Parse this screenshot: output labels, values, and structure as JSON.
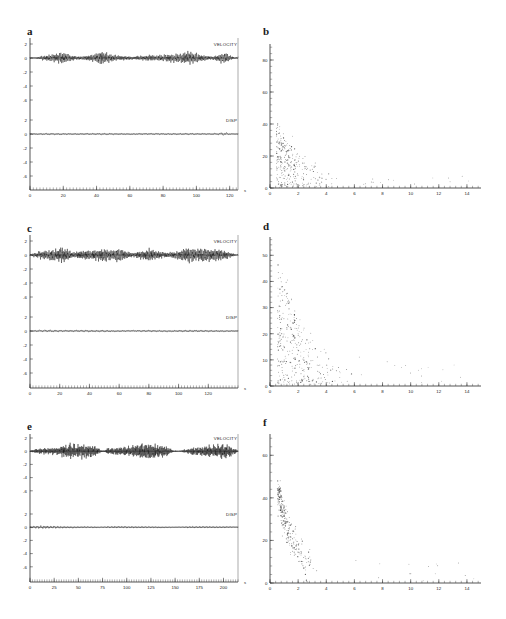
{
  "figure": {
    "background_color": "#ffffff",
    "trace_color": "#111111",
    "dot_color": "#3a3a3a",
    "axis_color": "#2a2a2a",
    "panel_letters": [
      "a",
      "b",
      "c",
      "d",
      "e",
      "f"
    ]
  },
  "panels": {
    "a": {
      "letter": "a",
      "type": "waveform"
    },
    "b": {
      "letter": "b",
      "type": "scatter"
    },
    "c": {
      "letter": "c",
      "type": "waveform"
    },
    "d": {
      "letter": "d",
      "type": "scatter"
    },
    "e": {
      "letter": "e",
      "type": "waveform"
    },
    "f": {
      "letter": "f",
      "type": "scatter"
    }
  },
  "chart_data": [
    {
      "panel": "a",
      "type": "line",
      "title": "",
      "xlabel": "s",
      "ylabel": "",
      "xlim": [
        0,
        125
      ],
      "ylim": [
        -7,
        3
      ],
      "grid": false,
      "legend_position": "right-inline",
      "xticks": [
        0,
        20,
        40,
        60,
        80,
        100,
        120
      ],
      "xtick_labels": [
        "0",
        "20",
        "40",
        "60",
        "80",
        "100",
        "120"
      ],
      "minor_tick_interval": 2,
      "x_unit": "s",
      "subplots": [
        {
          "name": "VELOCITY",
          "label": "VELOCITY",
          "yticks": [
            2,
            0,
            -2,
            -4,
            -6
          ],
          "ytick_labels": [
            "2",
            "0",
            "-2",
            "-4",
            "-6"
          ],
          "amplitude_envelope": [
            {
              "t": 0,
              "a": 0.05
            },
            {
              "t": 4,
              "a": 0.12
            },
            {
              "t": 8,
              "a": 0.3
            },
            {
              "t": 12,
              "a": 0.45
            },
            {
              "t": 16,
              "a": 0.62
            },
            {
              "t": 19,
              "a": 0.85
            },
            {
              "t": 22,
              "a": 0.55
            },
            {
              "t": 27,
              "a": 0.28
            },
            {
              "t": 32,
              "a": 0.22
            },
            {
              "t": 36,
              "a": 0.4
            },
            {
              "t": 40,
              "a": 0.72
            },
            {
              "t": 43,
              "a": 0.88
            },
            {
              "t": 47,
              "a": 0.6
            },
            {
              "t": 52,
              "a": 0.35
            },
            {
              "t": 57,
              "a": 0.26
            },
            {
              "t": 62,
              "a": 0.2
            },
            {
              "t": 67,
              "a": 0.3
            },
            {
              "t": 72,
              "a": 0.42
            },
            {
              "t": 77,
              "a": 0.36
            },
            {
              "t": 82,
              "a": 0.48
            },
            {
              "t": 87,
              "a": 0.58
            },
            {
              "t": 92,
              "a": 0.66
            },
            {
              "t": 96,
              "a": 0.8
            },
            {
              "t": 100,
              "a": 0.62
            },
            {
              "t": 105,
              "a": 0.3
            },
            {
              "t": 110,
              "a": 0.22
            },
            {
              "t": 114,
              "a": 0.55
            },
            {
              "t": 117,
              "a": 0.78
            },
            {
              "t": 120,
              "a": 0.35
            },
            {
              "t": 123,
              "a": 0.1
            }
          ]
        },
        {
          "name": "DISP",
          "label": "DISP",
          "yticks": [
            2,
            0,
            -2,
            -4,
            -6
          ],
          "ytick_labels": [
            "2",
            "0",
            "-2",
            "-4",
            "-6"
          ],
          "amplitude_envelope": [
            {
              "t": 0,
              "a": 0.04
            },
            {
              "t": 6,
              "a": 0.18
            },
            {
              "t": 12,
              "a": 0.24
            },
            {
              "t": 18,
              "a": 0.2
            },
            {
              "t": 24,
              "a": 0.15
            },
            {
              "t": 30,
              "a": 0.12
            },
            {
              "t": 38,
              "a": 0.18
            },
            {
              "t": 45,
              "a": 0.22
            },
            {
              "t": 52,
              "a": 0.14
            },
            {
              "t": 60,
              "a": 0.11
            },
            {
              "t": 68,
              "a": 0.16
            },
            {
              "t": 76,
              "a": 0.2
            },
            {
              "t": 84,
              "a": 0.17
            },
            {
              "t": 92,
              "a": 0.21
            },
            {
              "t": 100,
              "a": 0.18
            },
            {
              "t": 108,
              "a": 0.13
            },
            {
              "t": 114,
              "a": 0.3
            },
            {
              "t": 117,
              "a": 0.55
            },
            {
              "t": 120,
              "a": 0.2
            },
            {
              "t": 123,
              "a": 0.06
            }
          ]
        }
      ]
    },
    {
      "panel": "b",
      "type": "scatter",
      "title": "",
      "xlabel": "",
      "ylabel": "",
      "xlim": [
        0,
        15
      ],
      "ylim": [
        0,
        90
      ],
      "grid": false,
      "xticks": [
        0,
        2,
        4,
        6,
        8,
        10,
        12,
        14
      ],
      "xtick_labels": [
        "0",
        "2",
        "4",
        "6",
        "8",
        "10",
        "12",
        "14"
      ],
      "yticks": [
        0,
        20,
        40,
        60,
        80
      ],
      "ytick_labels": [
        "0",
        "20",
        "40",
        "60",
        "80"
      ],
      "n_points": 300,
      "cluster": {
        "shape": "decaying-L",
        "x_mode": 1.3,
        "x_decay": 1.9,
        "y_max_at_origin": 46,
        "y_spread": 13,
        "tail_x_max": 14.2
      }
    },
    {
      "panel": "c",
      "type": "line",
      "title": "",
      "xlabel": "s",
      "ylabel": "",
      "xlim": [
        0,
        140
      ],
      "ylim": [
        -7,
        3
      ],
      "grid": false,
      "legend_position": "right-inline",
      "xticks": [
        0,
        20,
        40,
        60,
        80,
        100,
        120
      ],
      "xtick_labels": [
        "0",
        "20",
        "40",
        "60",
        "80",
        "100",
        "120"
      ],
      "minor_tick_interval": 2,
      "x_unit": "s",
      "subplots": [
        {
          "name": "VELOCITY",
          "label": "VELOCITY",
          "yticks": [
            2,
            0,
            -2,
            -4,
            -6
          ],
          "ytick_labels": [
            "2",
            "0",
            "-2",
            "-4",
            "-6"
          ],
          "amplitude_envelope": [
            {
              "t": 0,
              "a": 0.06
            },
            {
              "t": 5,
              "a": 0.45
            },
            {
              "t": 10,
              "a": 0.62
            },
            {
              "t": 14,
              "a": 0.7
            },
            {
              "t": 18,
              "a": 0.85
            },
            {
              "t": 21,
              "a": 1.0
            },
            {
              "t": 25,
              "a": 0.7
            },
            {
              "t": 30,
              "a": 0.35
            },
            {
              "t": 34,
              "a": 0.5
            },
            {
              "t": 38,
              "a": 0.72
            },
            {
              "t": 42,
              "a": 0.55
            },
            {
              "t": 46,
              "a": 0.8
            },
            {
              "t": 50,
              "a": 0.95
            },
            {
              "t": 54,
              "a": 0.66
            },
            {
              "t": 58,
              "a": 0.88
            },
            {
              "t": 62,
              "a": 0.72
            },
            {
              "t": 66,
              "a": 0.42
            },
            {
              "t": 70,
              "a": 0.3
            },
            {
              "t": 75,
              "a": 0.55
            },
            {
              "t": 80,
              "a": 0.78
            },
            {
              "t": 84,
              "a": 0.62
            },
            {
              "t": 88,
              "a": 0.4
            },
            {
              "t": 93,
              "a": 0.3
            },
            {
              "t": 98,
              "a": 0.45
            },
            {
              "t": 103,
              "a": 0.8
            },
            {
              "t": 107,
              "a": 0.96
            },
            {
              "t": 111,
              "a": 0.75
            },
            {
              "t": 115,
              "a": 0.9
            },
            {
              "t": 119,
              "a": 1.0
            },
            {
              "t": 123,
              "a": 0.72
            },
            {
              "t": 127,
              "a": 0.85
            },
            {
              "t": 131,
              "a": 0.6
            },
            {
              "t": 135,
              "a": 0.3
            },
            {
              "t": 139,
              "a": 0.08
            }
          ]
        },
        {
          "name": "DISP",
          "label": "DISP",
          "yticks": [
            2,
            0,
            -2,
            -4,
            -6
          ],
          "ytick_labels": [
            "2",
            "0",
            "-2",
            "-4",
            "-6"
          ],
          "amplitude_envelope": [
            {
              "t": 0,
              "a": 0.05
            },
            {
              "t": 6,
              "a": 0.26
            },
            {
              "t": 12,
              "a": 0.32
            },
            {
              "t": 18,
              "a": 0.28
            },
            {
              "t": 24,
              "a": 0.2
            },
            {
              "t": 30,
              "a": 0.24
            },
            {
              "t": 38,
              "a": 0.3
            },
            {
              "t": 44,
              "a": 0.22
            },
            {
              "t": 50,
              "a": 0.26
            },
            {
              "t": 58,
              "a": 0.18
            },
            {
              "t": 66,
              "a": 0.14
            },
            {
              "t": 74,
              "a": 0.2
            },
            {
              "t": 82,
              "a": 0.24
            },
            {
              "t": 90,
              "a": 0.18
            },
            {
              "t": 98,
              "a": 0.22
            },
            {
              "t": 106,
              "a": 0.28
            },
            {
              "t": 114,
              "a": 0.24
            },
            {
              "t": 122,
              "a": 0.2
            },
            {
              "t": 130,
              "a": 0.16
            },
            {
              "t": 136,
              "a": 0.1
            },
            {
              "t": 139,
              "a": 0.05
            }
          ]
        }
      ]
    },
    {
      "panel": "d",
      "type": "scatter",
      "title": "",
      "xlabel": "",
      "ylabel": "",
      "xlim": [
        0,
        15
      ],
      "ylim": [
        0,
        57
      ],
      "grid": false,
      "xticks": [
        0,
        2,
        4,
        6,
        8,
        10,
        12,
        14
      ],
      "xtick_labels": [
        "0",
        "2",
        "4",
        "6",
        "8",
        "10",
        "12",
        "14"
      ],
      "yticks": [
        0,
        10,
        20,
        30,
        40,
        50
      ],
      "ytick_labels": [
        "0",
        "10",
        "20",
        "30",
        "40",
        "50"
      ],
      "n_points": 330,
      "cluster": {
        "shape": "decaying-L",
        "x_mode": 1.5,
        "x_decay": 2.3,
        "y_max_at_origin": 55,
        "y_spread": 14,
        "tail_x_max": 13.6
      }
    },
    {
      "panel": "e",
      "type": "line",
      "title": "",
      "xlabel": "s",
      "ylabel": "",
      "xlim": [
        0,
        215
      ],
      "ylim": [
        -7,
        3
      ],
      "grid": false,
      "legend_position": "right-inline",
      "xticks": [
        0,
        25,
        50,
        75,
        100,
        125,
        150,
        175,
        200
      ],
      "xtick_labels": [
        "0",
        "25",
        "50",
        "75",
        "100",
        "125",
        "150",
        "175",
        "200"
      ],
      "minor_tick_interval": 2.5,
      "x_unit": "s",
      "subplots": [
        {
          "name": "VELOCITY",
          "label": "VELOCITY",
          "yticks": [
            2,
            0,
            -2,
            -4,
            -6
          ],
          "ytick_labels": [
            "2",
            "0",
            "-2",
            "-4",
            "-6"
          ],
          "amplitude_envelope": [
            {
              "t": 0,
              "a": 0.05
            },
            {
              "t": 5,
              "a": 0.3
            },
            {
              "t": 12,
              "a": 0.38
            },
            {
              "t": 20,
              "a": 0.42
            },
            {
              "t": 28,
              "a": 0.55
            },
            {
              "t": 34,
              "a": 0.85
            },
            {
              "t": 40,
              "a": 1.0
            },
            {
              "t": 48,
              "a": 1.0
            },
            {
              "t": 55,
              "a": 0.95
            },
            {
              "t": 62,
              "a": 0.9
            },
            {
              "t": 68,
              "a": 0.7
            },
            {
              "t": 73,
              "a": 0.2
            },
            {
              "t": 76,
              "a": 0.08
            },
            {
              "t": 80,
              "a": 0.42
            },
            {
              "t": 88,
              "a": 0.52
            },
            {
              "t": 96,
              "a": 0.6
            },
            {
              "t": 104,
              "a": 0.75
            },
            {
              "t": 112,
              "a": 0.92
            },
            {
              "t": 120,
              "a": 1.0
            },
            {
              "t": 128,
              "a": 0.98
            },
            {
              "t": 136,
              "a": 0.85
            },
            {
              "t": 143,
              "a": 0.55
            },
            {
              "t": 148,
              "a": 0.12
            },
            {
              "t": 155,
              "a": 0.06
            },
            {
              "t": 163,
              "a": 0.35
            },
            {
              "t": 170,
              "a": 0.58
            },
            {
              "t": 178,
              "a": 0.66
            },
            {
              "t": 186,
              "a": 0.8
            },
            {
              "t": 193,
              "a": 0.95
            },
            {
              "t": 200,
              "a": 1.0
            },
            {
              "t": 207,
              "a": 0.8
            },
            {
              "t": 212,
              "a": 0.35
            },
            {
              "t": 215,
              "a": 0.08
            }
          ]
        },
        {
          "name": "DISP",
          "label": "DISP",
          "yticks": [
            2,
            0,
            -2,
            -4,
            -6
          ],
          "ytick_labels": [
            "2",
            "0",
            "-2",
            "-4",
            "-6"
          ],
          "amplitude_envelope": [
            {
              "t": 0,
              "a": 0.06
            },
            {
              "t": 5,
              "a": 0.4
            },
            {
              "t": 10,
              "a": 0.46
            },
            {
              "t": 16,
              "a": 0.44
            },
            {
              "t": 22,
              "a": 0.4
            },
            {
              "t": 30,
              "a": 0.34
            },
            {
              "t": 38,
              "a": 0.26
            },
            {
              "t": 48,
              "a": 0.22
            },
            {
              "t": 58,
              "a": 0.2
            },
            {
              "t": 68,
              "a": 0.18
            },
            {
              "t": 74,
              "a": 0.08
            },
            {
              "t": 80,
              "a": 0.24
            },
            {
              "t": 90,
              "a": 0.26
            },
            {
              "t": 100,
              "a": 0.24
            },
            {
              "t": 112,
              "a": 0.22
            },
            {
              "t": 124,
              "a": 0.22
            },
            {
              "t": 136,
              "a": 0.2
            },
            {
              "t": 145,
              "a": 0.12
            },
            {
              "t": 152,
              "a": 0.05
            },
            {
              "t": 163,
              "a": 0.22
            },
            {
              "t": 174,
              "a": 0.26
            },
            {
              "t": 186,
              "a": 0.24
            },
            {
              "t": 196,
              "a": 0.22
            },
            {
              "t": 206,
              "a": 0.18
            },
            {
              "t": 212,
              "a": 0.1
            },
            {
              "t": 215,
              "a": 0.05
            }
          ]
        }
      ]
    },
    {
      "panel": "f",
      "type": "scatter",
      "title": "",
      "xlabel": "",
      "ylabel": "",
      "xlim": [
        0,
        15
      ],
      "ylim": [
        0,
        70
      ],
      "grid": false,
      "xticks": [
        0,
        2,
        4,
        6,
        8,
        10,
        12,
        14
      ],
      "xtick_labels": [
        "0",
        "2",
        "4",
        "6",
        "8",
        "10",
        "12",
        "14"
      ],
      "yticks": [
        0,
        20,
        40,
        60
      ],
      "ytick_labels": [
        "0",
        "20",
        "40",
        "60"
      ],
      "n_points": 290,
      "cluster": {
        "shape": "diagonal-band",
        "x_mode": 1.5,
        "x_decay": 1.1,
        "y_max_at_origin": 62,
        "y_spread": 9,
        "tail_x_max": 14.5
      }
    }
  ]
}
